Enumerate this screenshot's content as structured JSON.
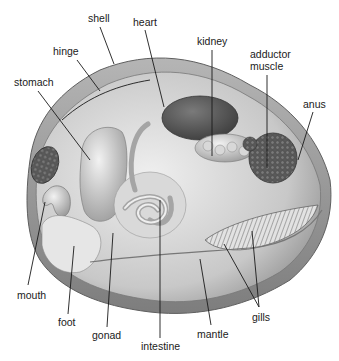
{
  "labels": {
    "shell": "shell",
    "heart": "heart",
    "hinge": "hinge",
    "kidney": "kidney",
    "adductor_line1": "adductor",
    "adductor_line2": "muscle",
    "stomach": "stomach",
    "anus": "anus",
    "mouth": "mouth",
    "foot": "foot",
    "gonad": "gonad",
    "intestine": "intestine",
    "mantle": "mantle",
    "gills": "gills"
  },
  "colors": {
    "background": "#ffffff",
    "shell_outer": "#9a9a9a",
    "shell_inner": "#c9c9c9",
    "body": "#d9d9d9",
    "organ_dark": "#5a5a5a",
    "text": "#1a1a1a"
  }
}
